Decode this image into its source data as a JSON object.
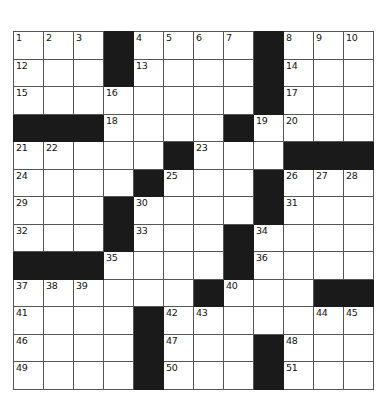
{
  "document": {
    "type": "crossword-puzzle-grid",
    "title": "",
    "background_color": "#ffffff",
    "ink_color": "#1a1a1a",
    "grid_line_color": "#555555"
  },
  "grid": {
    "columns": 12,
    "rows": 13,
    "cell_width_px": 29,
    "cell_height_px": 26.5,
    "origin_x_px": 13,
    "origin_y_px": 31,
    "black_color": "#1a1a1a",
    "white_color": "#ffffff",
    "cells": [
      [
        {
          "type": "white",
          "number": "1"
        },
        {
          "type": "white",
          "number": "2"
        },
        {
          "type": "white",
          "number": "3"
        },
        {
          "type": "black",
          "number": ""
        },
        {
          "type": "white",
          "number": "4"
        },
        {
          "type": "white",
          "number": "5"
        },
        {
          "type": "white",
          "number": "6"
        },
        {
          "type": "white",
          "number": "7"
        },
        {
          "type": "black",
          "number": ""
        },
        {
          "type": "white",
          "number": "8"
        },
        {
          "type": "white",
          "number": "9"
        },
        {
          "type": "white",
          "number": "10"
        }
      ],
      [
        {
          "type": "white",
          "number": "12"
        },
        {
          "type": "white",
          "number": ""
        },
        {
          "type": "white",
          "number": ""
        },
        {
          "type": "black",
          "number": ""
        },
        {
          "type": "white",
          "number": "13"
        },
        {
          "type": "white",
          "number": ""
        },
        {
          "type": "white",
          "number": ""
        },
        {
          "type": "white",
          "number": ""
        },
        {
          "type": "black",
          "number": ""
        },
        {
          "type": "white",
          "number": "14"
        },
        {
          "type": "white",
          "number": ""
        },
        {
          "type": "white",
          "number": ""
        }
      ],
      [
        {
          "type": "white",
          "number": "15"
        },
        {
          "type": "white",
          "number": ""
        },
        {
          "type": "white",
          "number": ""
        },
        {
          "type": "white",
          "number": "16"
        },
        {
          "type": "white",
          "number": ""
        },
        {
          "type": "white",
          "number": ""
        },
        {
          "type": "white",
          "number": ""
        },
        {
          "type": "white",
          "number": ""
        },
        {
          "type": "black",
          "number": ""
        },
        {
          "type": "white",
          "number": "17"
        },
        {
          "type": "white",
          "number": ""
        },
        {
          "type": "white",
          "number": ""
        }
      ],
      [
        {
          "type": "black",
          "number": ""
        },
        {
          "type": "black",
          "number": ""
        },
        {
          "type": "black",
          "number": ""
        },
        {
          "type": "white",
          "number": "18"
        },
        {
          "type": "white",
          "number": ""
        },
        {
          "type": "white",
          "number": ""
        },
        {
          "type": "white",
          "number": ""
        },
        {
          "type": "black",
          "number": ""
        },
        {
          "type": "white",
          "number": "19"
        },
        {
          "type": "white",
          "number": "20"
        },
        {
          "type": "white",
          "number": ""
        },
        {
          "type": "white",
          "number": ""
        }
      ],
      [
        {
          "type": "white",
          "number": "21"
        },
        {
          "type": "white",
          "number": "22"
        },
        {
          "type": "white",
          "number": ""
        },
        {
          "type": "white",
          "number": ""
        },
        {
          "type": "white",
          "number": ""
        },
        {
          "type": "black",
          "number": ""
        },
        {
          "type": "white",
          "number": "23"
        },
        {
          "type": "white",
          "number": ""
        },
        {
          "type": "white",
          "number": ""
        },
        {
          "type": "black",
          "number": ""
        },
        {
          "type": "black",
          "number": ""
        },
        {
          "type": "black",
          "number": ""
        }
      ],
      [
        {
          "type": "white",
          "number": "24"
        },
        {
          "type": "white",
          "number": ""
        },
        {
          "type": "white",
          "number": ""
        },
        {
          "type": "white",
          "number": ""
        },
        {
          "type": "black",
          "number": ""
        },
        {
          "type": "white",
          "number": "25"
        },
        {
          "type": "white",
          "number": ""
        },
        {
          "type": "white",
          "number": ""
        },
        {
          "type": "black",
          "number": ""
        },
        {
          "type": "white",
          "number": "26"
        },
        {
          "type": "white",
          "number": "27"
        },
        {
          "type": "white",
          "number": "28"
        }
      ],
      [
        {
          "type": "white",
          "number": "29"
        },
        {
          "type": "white",
          "number": ""
        },
        {
          "type": "white",
          "number": ""
        },
        {
          "type": "black",
          "number": ""
        },
        {
          "type": "white",
          "number": "30"
        },
        {
          "type": "white",
          "number": ""
        },
        {
          "type": "white",
          "number": ""
        },
        {
          "type": "white",
          "number": ""
        },
        {
          "type": "black",
          "number": ""
        },
        {
          "type": "white",
          "number": "31"
        },
        {
          "type": "white",
          "number": ""
        },
        {
          "type": "white",
          "number": ""
        }
      ],
      [
        {
          "type": "white",
          "number": "32"
        },
        {
          "type": "white",
          "number": ""
        },
        {
          "type": "white",
          "number": ""
        },
        {
          "type": "black",
          "number": ""
        },
        {
          "type": "white",
          "number": "33"
        },
        {
          "type": "white",
          "number": ""
        },
        {
          "type": "white",
          "number": ""
        },
        {
          "type": "black",
          "number": ""
        },
        {
          "type": "white",
          "number": "34"
        },
        {
          "type": "white",
          "number": ""
        },
        {
          "type": "white",
          "number": ""
        },
        {
          "type": "white",
          "number": ""
        }
      ],
      [
        {
          "type": "black",
          "number": ""
        },
        {
          "type": "black",
          "number": ""
        },
        {
          "type": "black",
          "number": ""
        },
        {
          "type": "white",
          "number": "35"
        },
        {
          "type": "white",
          "number": ""
        },
        {
          "type": "white",
          "number": ""
        },
        {
          "type": "white",
          "number": ""
        },
        {
          "type": "black",
          "number": ""
        },
        {
          "type": "white",
          "number": "36"
        },
        {
          "type": "white",
          "number": ""
        },
        {
          "type": "white",
          "number": ""
        },
        {
          "type": "white",
          "number": ""
        }
      ],
      [
        {
          "type": "white",
          "number": "37"
        },
        {
          "type": "white",
          "number": "38"
        },
        {
          "type": "white",
          "number": "39"
        },
        {
          "type": "white",
          "number": ""
        },
        {
          "type": "white",
          "number": ""
        },
        {
          "type": "white",
          "number": ""
        },
        {
          "type": "black",
          "number": ""
        },
        {
          "type": "white",
          "number": "40"
        },
        {
          "type": "white",
          "number": ""
        },
        {
          "type": "white",
          "number": ""
        },
        {
          "type": "black",
          "number": ""
        },
        {
          "type": "black",
          "number": ""
        }
      ],
      [
        {
          "type": "white",
          "number": "41"
        },
        {
          "type": "white",
          "number": ""
        },
        {
          "type": "white",
          "number": ""
        },
        {
          "type": "white",
          "number": ""
        },
        {
          "type": "black",
          "number": ""
        },
        {
          "type": "white",
          "number": "42"
        },
        {
          "type": "white",
          "number": "43"
        },
        {
          "type": "white",
          "number": ""
        },
        {
          "type": "white",
          "number": ""
        },
        {
          "type": "white",
          "number": ""
        },
        {
          "type": "white",
          "number": "44"
        },
        {
          "type": "white",
          "number": "45"
        }
      ],
      [
        {
          "type": "white",
          "number": "46"
        },
        {
          "type": "white",
          "number": ""
        },
        {
          "type": "white",
          "number": ""
        },
        {
          "type": "white",
          "number": ""
        },
        {
          "type": "black",
          "number": ""
        },
        {
          "type": "white",
          "number": "47"
        },
        {
          "type": "white",
          "number": ""
        },
        {
          "type": "white",
          "number": ""
        },
        {
          "type": "black",
          "number": ""
        },
        {
          "type": "white",
          "number": "48"
        },
        {
          "type": "white",
          "number": ""
        },
        {
          "type": "white",
          "number": ""
        }
      ],
      [
        {
          "type": "white",
          "number": "49"
        },
        {
          "type": "white",
          "number": ""
        },
        {
          "type": "white",
          "number": ""
        },
        {
          "type": "white",
          "number": ""
        },
        {
          "type": "black",
          "number": ""
        },
        {
          "type": "white",
          "number": "50"
        },
        {
          "type": "white",
          "number": ""
        },
        {
          "type": "white",
          "number": ""
        },
        {
          "type": "black",
          "number": ""
        },
        {
          "type": "white",
          "number": "51"
        },
        {
          "type": "white",
          "number": ""
        },
        {
          "type": "white",
          "number": ""
        }
      ]
    ]
  }
}
